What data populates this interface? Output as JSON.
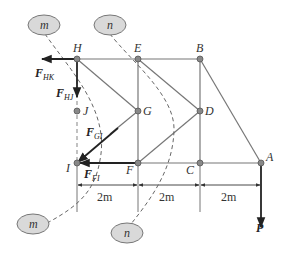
{
  "figure": {
    "nodes": [
      {
        "id": "H",
        "label": "H",
        "x": 77,
        "y": 59
      },
      {
        "id": "E",
        "label": "E",
        "x": 138,
        "y": 59
      },
      {
        "id": "B",
        "label": "B",
        "x": 200,
        "y": 59
      },
      {
        "id": "J",
        "label": "J",
        "x": 77,
        "y": 111
      },
      {
        "id": "G",
        "label": "G",
        "x": 138,
        "y": 111
      },
      {
        "id": "D",
        "label": "D",
        "x": 200,
        "y": 111
      },
      {
        "id": "I",
        "label": "I",
        "x": 77,
        "y": 163
      },
      {
        "id": "F",
        "label": "F",
        "x": 138,
        "y": 163
      },
      {
        "id": "C",
        "label": "C",
        "x": 200,
        "y": 163
      },
      {
        "id": "A",
        "label": "A",
        "x": 261,
        "y": 163
      }
    ],
    "members": [
      [
        "H",
        "E"
      ],
      [
        "E",
        "B"
      ],
      [
        "B",
        "D"
      ],
      [
        "D",
        "C"
      ],
      [
        "E",
        "G"
      ],
      [
        "G",
        "F"
      ],
      [
        "F",
        "C"
      ],
      [
        "C",
        "A"
      ],
      [
        "B",
        "A"
      ],
      [
        "H",
        "G"
      ],
      [
        "E",
        "D"
      ],
      [
        "G",
        "D"
      ],
      [
        "F",
        "D"
      ],
      [
        "I",
        "G"
      ]
    ],
    "forces": [
      {
        "id": "F_HK",
        "main": "F",
        "sub": "HK"
      },
      {
        "id": "F_HJ",
        "main": "F",
        "sub": "HJ"
      },
      {
        "id": "F_GI",
        "main": "F",
        "sub": "GI"
      },
      {
        "id": "F_FI",
        "main": "F",
        "sub": "FI"
      },
      {
        "id": "P",
        "main": "P",
        "sub": ""
      }
    ],
    "section_cuts": [
      {
        "id": "m",
        "label": "m"
      },
      {
        "id": "n",
        "label": "n"
      }
    ],
    "dimensions": [
      "2m",
      "2m",
      "2m"
    ],
    "colors": {
      "line": "#777777",
      "node": "#888888",
      "force": "#222222",
      "ellipse_fill": "#d9d9d9"
    }
  }
}
